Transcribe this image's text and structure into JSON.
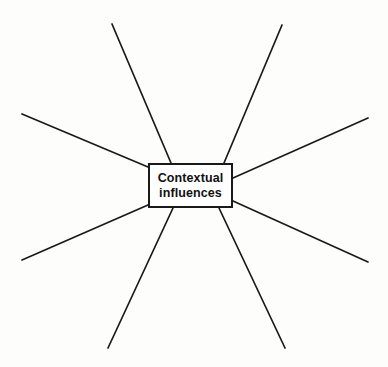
{
  "diagram": {
    "type": "radial-spider-map",
    "title": "Contextual influences",
    "background_color": "#fdfdfc",
    "stroke_color": "#1a1a1a",
    "central_node": {
      "label_line_1": "Contextual",
      "label_line_2": "influences",
      "full_label": "Contextual influences",
      "x": 148,
      "y": 163,
      "width": 85,
      "height": 45,
      "border_width": 2,
      "fill_color": "#ffffff",
      "text_color": "#111111",
      "font_weight": "bold",
      "font_size": 12.5
    },
    "spoke_count": 8,
    "spokes": [
      {
        "name": "spoke-upper-left",
        "x1": 148,
        "y1": 167,
        "x2": 22,
        "y2": 114,
        "width": 1.7
      },
      {
        "name": "spoke-top-left",
        "x1": 171,
        "y1": 163,
        "x2": 112,
        "y2": 24,
        "width": 1.7
      },
      {
        "name": "spoke-top-right",
        "x1": 224,
        "y1": 163,
        "x2": 282,
        "y2": 25,
        "width": 1.7
      },
      {
        "name": "spoke-upper-right",
        "x1": 233,
        "y1": 178,
        "x2": 368,
        "y2": 118,
        "width": 1.7
      },
      {
        "name": "spoke-lower-right",
        "x1": 233,
        "y1": 201,
        "x2": 368,
        "y2": 262,
        "width": 1.7
      },
      {
        "name": "spoke-bottom-right",
        "x1": 219,
        "y1": 208,
        "x2": 285,
        "y2": 348,
        "width": 1.7
      },
      {
        "name": "spoke-bottom-left",
        "x1": 173,
        "y1": 208,
        "x2": 108,
        "y2": 348,
        "width": 1.7
      },
      {
        "name": "spoke-lower-left",
        "x1": 148,
        "y1": 205,
        "x2": 22,
        "y2": 260,
        "width": 1.7
      }
    ]
  }
}
